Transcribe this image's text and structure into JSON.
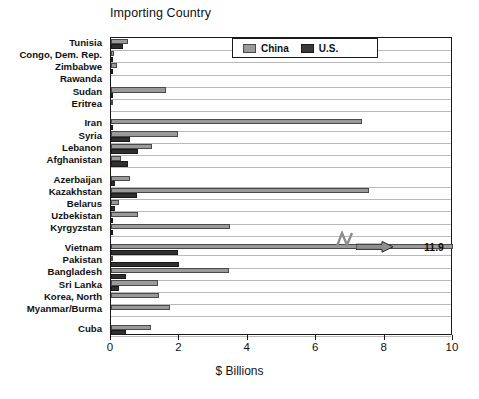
{
  "chart_data": {
    "type": "bar",
    "orientation": "horizontal",
    "title": "Importing Country",
    "xlabel": "$ Billions",
    "ylabel": "",
    "xlim": [
      0,
      10
    ],
    "xticks": [
      0,
      2,
      4,
      6,
      8,
      10
    ],
    "xtick_labels": [
      "0",
      "2",
      "4",
      "6",
      "8",
      "10"
    ],
    "grid": true,
    "legend_position": "top-center",
    "categories": [
      "Tunisia",
      "Congo, Dem. Rep.",
      "Zimbabwe",
      "Rawanda",
      "Sudan",
      "Eritrea",
      "Iran",
      "Syria",
      "Lebanon",
      "Afghanistan",
      "Azerbaijan",
      "Kazakhstan",
      "Belarus",
      "Uzbekistan",
      "Kyrgyzstan",
      "Vietnam",
      "Pakistan",
      "Bangladesh",
      "Sri Lanka",
      "Korea, North",
      "Myanmar/Burma",
      "Cuba"
    ],
    "group_breaks_after": [
      "Eritrea",
      "Afghanistan",
      "Kyrgyzstan",
      "Myanmar/Burma"
    ],
    "series": [
      {
        "name": "China",
        "color": "#9a9a9a",
        "values": [
          0.5,
          0.08,
          0.17,
          0.0,
          1.62,
          0.04,
          7.34,
          1.95,
          1.2,
          0.3,
          0.56,
          7.54,
          0.22,
          0.8,
          3.47,
          11.9,
          0.05,
          3.44,
          1.38,
          1.4,
          1.72,
          1.18
        ]
      },
      {
        "name": "U.S.",
        "color": "#2f2f2f",
        "values": [
          0.36,
          0.04,
          0.02,
          0.0,
          0.05,
          0.0,
          0.02,
          0.55,
          0.8,
          0.5,
          0.13,
          0.75,
          0.12,
          0.02,
          0.04,
          1.95,
          2.0,
          0.44,
          0.24,
          0.0,
          0.0,
          0.44
        ]
      }
    ],
    "annotations": [
      {
        "name": "vietnam-overflow",
        "label": "11.9",
        "category": "Vietnam",
        "series": "China",
        "note": "bar exceeds axis maximum; axis break + arrow"
      }
    ]
  },
  "legend": {
    "items": [
      {
        "label": "China",
        "key": "china"
      },
      {
        "label": "U.S.",
        "key": "us"
      }
    ]
  },
  "colors": {
    "china": "#9a9a9a",
    "us": "#2f2f2f",
    "axis": "#1a1a1a",
    "grid": "#b9b9b9",
    "background": "#ffffff"
  }
}
